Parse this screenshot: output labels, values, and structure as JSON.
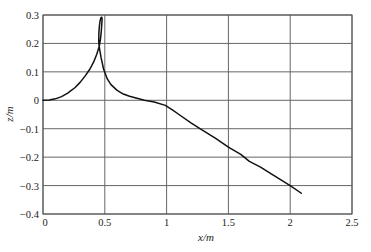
{
  "chart_data": {
    "type": "line",
    "title": "",
    "xlabel": "x/m",
    "ylabel": "z/m",
    "xlim": [
      0,
      2.5
    ],
    "ylim": [
      -0.4,
      0.3
    ],
    "xticks": [
      0,
      0.5,
      1,
      1.5,
      2,
      2.5
    ],
    "xtick_labels": [
      "0",
      "0.5",
      "1",
      "1.5",
      "2",
      "2.5"
    ],
    "yticks": [
      0.3,
      0.2,
      0.1,
      0,
      -0.1,
      -0.2,
      -0.3,
      -0.4
    ],
    "ytick_labels": [
      "0.3",
      "0.2",
      "0.1",
      "0",
      "−0.1",
      "−0.2",
      "−0.3",
      "−0.4"
    ],
    "grid": true,
    "legend": null,
    "series": [
      {
        "name": "trajectory",
        "color": "#111111",
        "x": [
          0,
          0.05,
          0.1,
          0.15,
          0.2,
          0.26,
          0.3,
          0.34,
          0.38,
          0.41,
          0.435,
          0.455,
          0.465,
          0.472,
          0.476,
          0.478,
          0.476,
          0.47,
          0.462,
          0.456,
          0.452,
          0.451,
          0.453,
          0.458,
          0.47,
          0.49,
          0.52,
          0.55,
          0.6,
          0.65,
          0.7,
          0.76,
          0.82,
          0.9,
          0.99,
          1.05,
          1.1,
          1.2,
          1.27,
          1.4,
          1.5,
          1.6,
          1.67,
          1.76,
          1.85,
          2.0,
          2.09
        ],
        "y": [
          0,
          0.001,
          0.005,
          0.013,
          0.025,
          0.045,
          0.063,
          0.085,
          0.11,
          0.135,
          0.162,
          0.19,
          0.215,
          0.245,
          0.27,
          0.285,
          0.292,
          0.291,
          0.28,
          0.26,
          0.235,
          0.21,
          0.195,
          0.18,
          0.15,
          0.11,
          0.075,
          0.055,
          0.035,
          0.022,
          0.014,
          0.007,
          0.0,
          -0.006,
          -0.018,
          -0.035,
          -0.05,
          -0.08,
          -0.1,
          -0.135,
          -0.165,
          -0.19,
          -0.215,
          -0.235,
          -0.26,
          -0.3,
          -0.327
        ]
      }
    ]
  }
}
